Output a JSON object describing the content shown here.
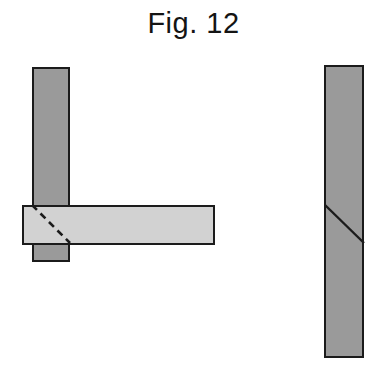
{
  "figure": {
    "caption": "Fig. 12",
    "caption_color": "#141414",
    "background_color": "#ffffff"
  },
  "palette": {
    "post_fill": "#9a9a9a",
    "beam_fill": "#d2d2d2",
    "outline": "#1b1b1b",
    "hidden_line": "#1b1b1b"
  },
  "views": {
    "left_view": {
      "name": "elevation-view",
      "parts": [
        {
          "name": "vertical-post",
          "shape": "rectangle",
          "fill": "#9a9a9a",
          "x": 32,
          "y": 67,
          "width": 38,
          "height": 195
        },
        {
          "name": "horizontal-beam",
          "shape": "rectangle",
          "fill": "#d2d2d2",
          "x": 22,
          "y": 205,
          "width": 193,
          "height": 40
        },
        {
          "name": "hidden-diagonal-cut",
          "shape": "dashed-line",
          "stroke": "#1b1b1b",
          "dash": "7 5",
          "x1": 32,
          "y1": 205,
          "x2": 70,
          "y2": 243
        }
      ]
    },
    "right_view": {
      "name": "section-view",
      "parts": [
        {
          "name": "vertical-member",
          "shape": "rectangle",
          "fill": "#9a9a9a",
          "x": 324,
          "y": 65,
          "width": 40,
          "height": 293
        },
        {
          "name": "visible-diagonal-cut",
          "shape": "solid-line",
          "stroke": "#1b1b1b",
          "x1": 325,
          "y1": 205,
          "x2": 364,
          "y2": 243
        }
      ]
    }
  }
}
